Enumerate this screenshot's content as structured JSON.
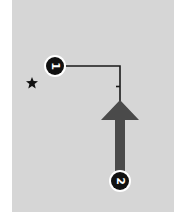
{
  "diagram": {
    "background_color": "#d6d6d6",
    "markers": [
      {
        "id": "marker-1",
        "label": "1",
        "rotation_deg": 90
      },
      {
        "id": "marker-2",
        "label": "2",
        "rotation_deg": 90
      }
    ],
    "icons": [
      "star-icon",
      "direction-arrow-icon"
    ],
    "colors": {
      "line": "#1a1a1a",
      "arrow": "#4a4a4a",
      "badge_fill": "#111111",
      "badge_ring": "#ffffff"
    }
  }
}
